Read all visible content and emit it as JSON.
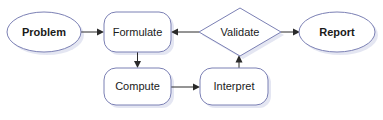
{
  "diagram": {
    "type": "flowchart",
    "background_color": "#ffffff",
    "shape_stroke_color": "#7b80b4",
    "shape_fill_color": "#ffffff",
    "shadow_color": "#dfe2f0",
    "edge_color": "#2a2a2a",
    "label_color": "#1a1a1a",
    "nodes": [
      {
        "id": "problem",
        "label": "Problem",
        "shape": "ellipse",
        "bold": true,
        "cx": 44,
        "cy": 32,
        "rx": 37,
        "ry": 20
      },
      {
        "id": "formulate",
        "label": "Formulate",
        "shape": "rounded-rect",
        "bold": false,
        "x": 104,
        "y": 12,
        "w": 67,
        "h": 40,
        "r": 12
      },
      {
        "id": "validate",
        "label": "Validate",
        "shape": "diamond",
        "bold": false,
        "cx": 240,
        "cy": 32,
        "rx": 41,
        "ry": 24
      },
      {
        "id": "report",
        "label": "Report",
        "shape": "ellipse",
        "bold": true,
        "cx": 337,
        "cy": 32,
        "rx": 38,
        "ry": 20
      },
      {
        "id": "compute",
        "label": "Compute",
        "shape": "rounded-rect",
        "bold": false,
        "x": 104,
        "y": 68,
        "w": 67,
        "h": 37,
        "r": 12
      },
      {
        "id": "interpret",
        "label": "Interpret",
        "shape": "rounded-rect",
        "bold": false,
        "x": 200,
        "y": 68,
        "w": 68,
        "h": 37,
        "r": 12
      }
    ],
    "edges": [
      {
        "id": "problem-to-formulate",
        "from": "problem",
        "to": "formulate",
        "direction": "right"
      },
      {
        "id": "validate-to-formulate",
        "from": "validate",
        "to": "formulate",
        "direction": "left"
      },
      {
        "id": "validate-to-report",
        "from": "validate",
        "to": "report",
        "direction": "right"
      },
      {
        "id": "formulate-to-compute",
        "from": "formulate",
        "to": "compute",
        "direction": "down"
      },
      {
        "id": "compute-to-interpret",
        "from": "compute",
        "to": "interpret",
        "direction": "right"
      },
      {
        "id": "interpret-to-validate",
        "from": "interpret",
        "to": "validate",
        "direction": "up"
      }
    ]
  }
}
